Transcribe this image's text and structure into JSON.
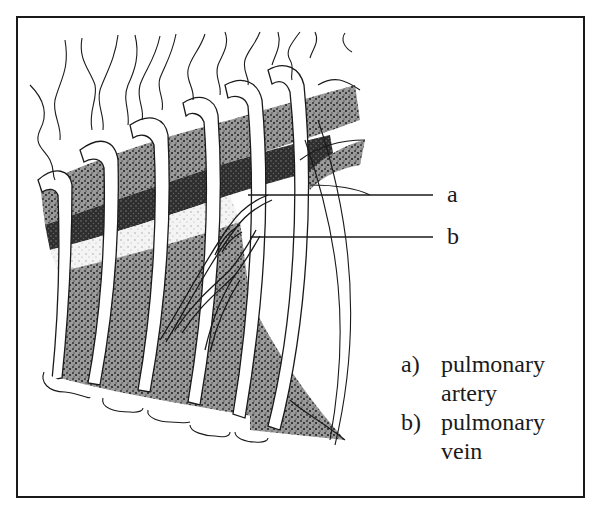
{
  "figure": {
    "labels": {
      "a": "a",
      "b": "b"
    },
    "legend": [
      {
        "key": "a)",
        "line1": "pulmonary",
        "line2": "artery"
      },
      {
        "key": "b)",
        "line1": "pulmonary",
        "line2": "vein"
      }
    ],
    "colors": {
      "ink": "#1a1a1a",
      "stipple_dark": "#2a2a2a",
      "stipple_light": "#8a8a8a",
      "background": "#ffffff"
    }
  }
}
